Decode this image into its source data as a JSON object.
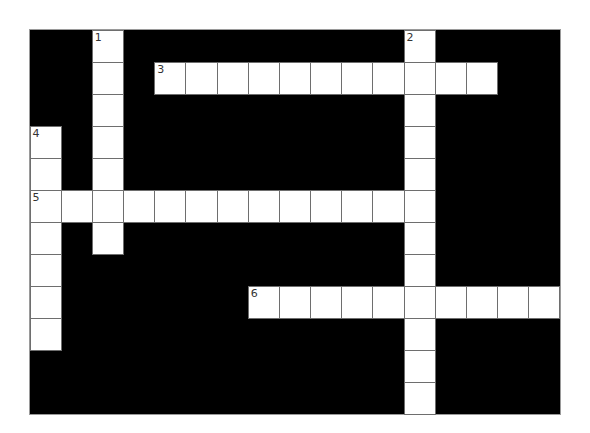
{
  "puzzle": {
    "rows": 12,
    "cols": 17,
    "colors": {
      "block": "#000000",
      "cell": "#ffffff",
      "cell_border": "#6e6e6e",
      "number": "#333333"
    },
    "words": [
      {
        "number": "1",
        "direction": "down",
        "row": 0,
        "col": 2,
        "length": 7
      },
      {
        "number": "2",
        "direction": "down",
        "row": 0,
        "col": 12,
        "length": 12
      },
      {
        "number": "3",
        "direction": "across",
        "row": 1,
        "col": 4,
        "length": 11
      },
      {
        "number": "4",
        "direction": "down",
        "row": 3,
        "col": 0,
        "length": 7
      },
      {
        "number": "5",
        "direction": "across",
        "row": 5,
        "col": 0,
        "length": 13
      },
      {
        "number": "6",
        "direction": "across",
        "row": 8,
        "col": 7,
        "length": 10
      }
    ]
  }
}
